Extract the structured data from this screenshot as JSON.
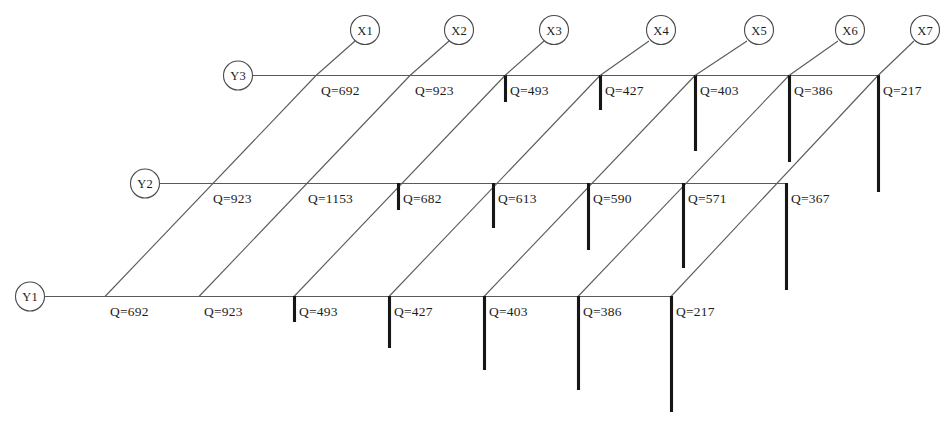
{
  "diagram": {
    "colors": {
      "grid_line": "#5a5a5a",
      "load_bar": "#161616",
      "text": "#1c1c1c",
      "background": "#ffffff"
    },
    "column_axes": [
      {
        "id": "x1",
        "label": "X1"
      },
      {
        "id": "x2",
        "label": "X2"
      },
      {
        "id": "x3",
        "label": "X3"
      },
      {
        "id": "x4",
        "label": "X4"
      },
      {
        "id": "x5",
        "label": "X5"
      },
      {
        "id": "x6",
        "label": "X6"
      },
      {
        "id": "x7",
        "label": "X7"
      }
    ],
    "row_axes": [
      {
        "id": "y3",
        "label": "Y3"
      },
      {
        "id": "y2",
        "label": "Y2"
      },
      {
        "id": "y1",
        "label": "Y1"
      }
    ],
    "rows": [
      {
        "id": "y3",
        "label": "Y3",
        "cells": [
          {
            "bay": "X1-X2",
            "label": "Q=692",
            "value": 692
          },
          {
            "bay": "X2-X3",
            "label": "Q=923",
            "value": 923
          },
          {
            "bay": "X3-X4",
            "label": "Q=493",
            "value": 493
          },
          {
            "bay": "X4-X5",
            "label": "Q=427",
            "value": 427
          },
          {
            "bay": "X5-X6",
            "label": "Q=403",
            "value": 403
          },
          {
            "bay": "X6-X7",
            "label": "Q=386",
            "value": 386
          },
          {
            "bay": "X7",
            "label": "Q=217",
            "value": 217
          }
        ]
      },
      {
        "id": "y2",
        "label": "Y2",
        "cells": [
          {
            "bay": "X1-X2",
            "label": "Q=923",
            "value": 923
          },
          {
            "bay": "X2-X3",
            "label": "Q=1153",
            "value": 1153
          },
          {
            "bay": "X3-X4",
            "label": "Q=682",
            "value": 682
          },
          {
            "bay": "X4-X5",
            "label": "Q=613",
            "value": 613
          },
          {
            "bay": "X5-X6",
            "label": "Q=590",
            "value": 590
          },
          {
            "bay": "X6-X7",
            "label": "Q=571",
            "value": 571
          },
          {
            "bay": "X7",
            "label": "Q=367",
            "value": 367
          }
        ]
      },
      {
        "id": "y1",
        "label": "Y1",
        "cells": [
          {
            "bay": "X1-X2",
            "label": "Q=692",
            "value": 692
          },
          {
            "bay": "X2-X3",
            "label": "Q=923",
            "value": 923
          },
          {
            "bay": "X3-X4",
            "label": "Q=493",
            "value": 493
          },
          {
            "bay": "X4-X5",
            "label": "Q=427",
            "value": 427
          },
          {
            "bay": "X5-X6",
            "label": "Q=403",
            "value": 403
          },
          {
            "bay": "X6-X7",
            "label": "Q=386",
            "value": 386
          },
          {
            "bay": "X7",
            "label": "Q=217",
            "value": 217
          }
        ]
      }
    ]
  }
}
